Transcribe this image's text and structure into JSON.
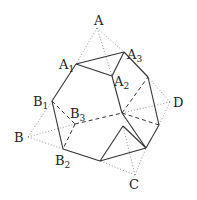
{
  "diagram": {
    "type": "truncated-tetrahedron",
    "labels": [
      {
        "id": "A",
        "text": "A",
        "sub": "",
        "x": 94,
        "y": 25
      },
      {
        "id": "A1",
        "text": "A",
        "sub": "1",
        "x": 59,
        "y": 69
      },
      {
        "id": "A2",
        "text": "A",
        "sub": "2",
        "x": 114,
        "y": 86
      },
      {
        "id": "A3",
        "text": "A",
        "sub": "3",
        "x": 127,
        "y": 59
      },
      {
        "id": "B",
        "text": "B",
        "sub": "",
        "x": 14,
        "y": 142
      },
      {
        "id": "B1",
        "text": "B",
        "sub": "1",
        "x": 33,
        "y": 106
      },
      {
        "id": "B2",
        "text": "B",
        "sub": "2",
        "x": 55,
        "y": 165
      },
      {
        "id": "B3",
        "text": "B",
        "sub": "3",
        "x": 70,
        "y": 118
      },
      {
        "id": "C",
        "text": "C",
        "sub": "",
        "x": 129,
        "y": 189
      },
      {
        "id": "D",
        "text": "D",
        "sub": "",
        "x": 173,
        "y": 107
      }
    ],
    "solid_edges": [
      [
        76,
        64,
        124,
        52
      ],
      [
        76,
        64,
        112,
        76
      ],
      [
        112,
        76,
        124,
        52
      ],
      [
        76,
        64,
        52,
        101
      ],
      [
        52,
        101,
        63,
        149
      ],
      [
        63,
        149,
        100,
        161
      ],
      [
        112,
        76,
        122,
        113
      ],
      [
        122,
        113,
        146,
        148
      ],
      [
        124,
        52,
        148,
        77
      ],
      [
        148,
        77,
        159,
        125
      ],
      [
        159,
        125,
        146,
        148
      ],
      [
        100,
        161,
        146,
        148
      ],
      [
        100,
        161,
        123,
        126
      ],
      [
        123,
        126,
        146,
        148
      ]
    ],
    "dashed_edges": [
      [
        52,
        101,
        75,
        124
      ],
      [
        75,
        124,
        63,
        149
      ],
      [
        75,
        124,
        122,
        113
      ],
      [
        122,
        113,
        159,
        125
      ],
      [
        122,
        113,
        148,
        77
      ]
    ],
    "dotted_edges": [
      [
        97,
        28,
        76,
        64
      ],
      [
        97,
        28,
        112,
        76
      ],
      [
        97,
        28,
        124,
        52
      ],
      [
        28,
        137,
        52,
        101
      ],
      [
        28,
        137,
        63,
        149
      ],
      [
        28,
        137,
        75,
        124
      ],
      [
        135,
        175,
        100,
        161
      ],
      [
        135,
        175,
        146,
        148
      ],
      [
        135,
        175,
        123,
        126
      ],
      [
        170,
        102,
        148,
        77
      ],
      [
        170,
        102,
        159,
        125
      ],
      [
        170,
        102,
        122,
        113
      ]
    ]
  }
}
